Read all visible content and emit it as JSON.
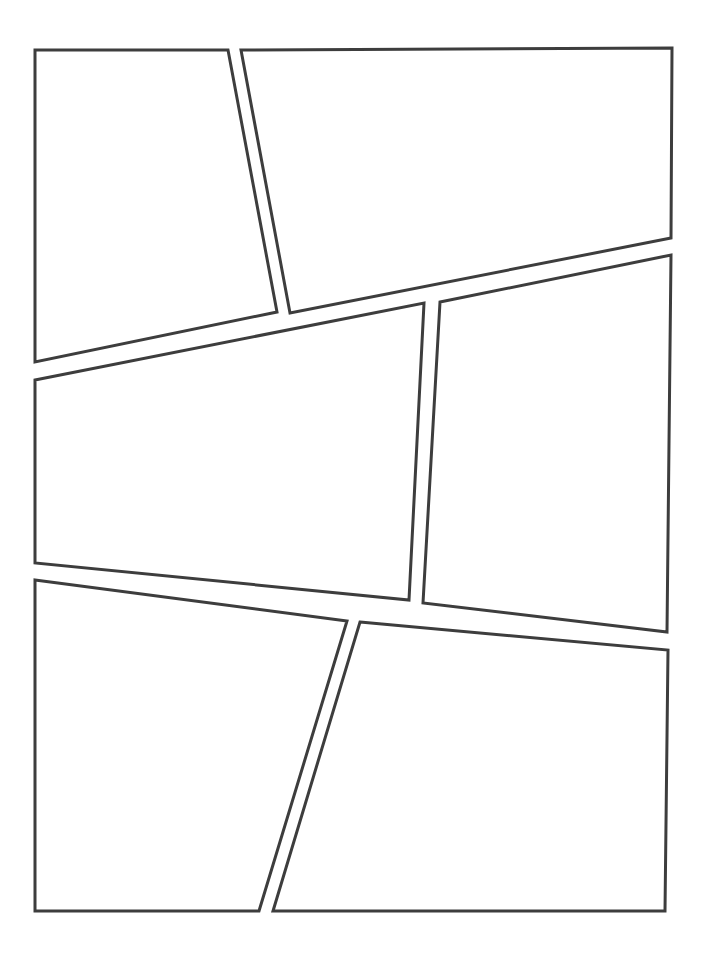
{
  "document": {
    "kind": "comic-page-template",
    "title": "Blank Comic Book Page Layout",
    "page_width": 707,
    "page_height": 954,
    "background_color": "#ffffff",
    "panel_fill_color": "#ffffff",
    "panel_stroke_color": "#3d3d3d",
    "panel_stroke_width": 3,
    "panel_count": 6,
    "gutter_style": "irregular-angled"
  },
  "panels": [
    {
      "id": "panel-1",
      "label": "Panel 1",
      "position": "top-left",
      "points": "35,50 228,50 277,312 35,362"
    },
    {
      "id": "panel-2",
      "label": "Panel 2",
      "position": "top-right",
      "points": "241,50 672,48 671,238 290,313"
    },
    {
      "id": "panel-3",
      "label": "Panel 3",
      "position": "middle-left",
      "points": "35,380 424,303 409,600 35,563"
    },
    {
      "id": "panel-4",
      "label": "Panel 4",
      "position": "middle-right",
      "points": "440,302 671,255 667,632 423,603"
    },
    {
      "id": "panel-5",
      "label": "Panel 5",
      "position": "bottom-left",
      "points": "35,580 347,621 259,911 35,911"
    },
    {
      "id": "panel-6",
      "label": "Panel 6",
      "position": "bottom-right",
      "points": "360,622 668,650 665,911 273,911"
    }
  ]
}
